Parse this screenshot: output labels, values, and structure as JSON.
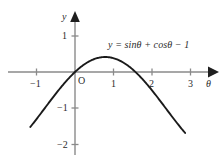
{
  "chart_data": {
    "type": "line",
    "title": "",
    "annotations": [
      {
        "name": "curve-equation",
        "text": "y = sinθ + cosθ − 1",
        "x": 1.0,
        "y": 0.75
      }
    ],
    "xlabel": "θ",
    "ylabel": "y",
    "xlim": [
      -1.45,
      3.55
    ],
    "ylim": [
      -2.35,
      1.35
    ],
    "grid": false,
    "legend": null,
    "x_ticks": [
      -1,
      1,
      2,
      3
    ],
    "x_tick_labels": [
      "−1",
      "1",
      "2",
      "3"
    ],
    "y_ticks": [
      1,
      -1,
      -2
    ],
    "y_tick_labels": [
      "1",
      "−1",
      "−2"
    ],
    "origin_label": "O",
    "series": [
      {
        "name": "y = sinθ + cosθ − 1",
        "color": "#1a1a1a",
        "x_start": -1.16,
        "x_end": 2.86,
        "points": [
          {
            "x": -1.16,
            "y": -1.07
          },
          {
            "x": -1.0,
            "y": -0.9
          },
          {
            "x": -0.8,
            "y": -0.02
          },
          {
            "x": -0.8,
            "y": -0.68
          },
          {
            "x": -0.6,
            "y": -0.74
          },
          {
            "x": -0.4,
            "y": -0.47
          },
          {
            "x": -0.2,
            "y": -0.22
          },
          {
            "x": 0.0,
            "y": 0.0
          },
          {
            "x": 0.2,
            "y": 0.18
          },
          {
            "x": 0.4,
            "y": 0.31
          },
          {
            "x": 0.6,
            "y": 0.39
          },
          {
            "x": 0.785,
            "y": 0.414
          },
          {
            "x": 1.0,
            "y": 0.38
          },
          {
            "x": 1.2,
            "y": 0.29
          },
          {
            "x": 1.4,
            "y": 0.16
          },
          {
            "x": 1.5708,
            "y": 0.0
          },
          {
            "x": 1.8,
            "y": -0.25
          },
          {
            "x": 2.0,
            "y": -0.5
          },
          {
            "x": 2.2,
            "y": -0.78
          },
          {
            "x": 2.4,
            "y": -1.06
          },
          {
            "x": 2.6,
            "y": -1.34
          },
          {
            "x": 2.86,
            "y": -1.68
          }
        ]
      }
    ],
    "axis_color": "#8a8a8a",
    "curve_color": "#1a1a1a",
    "arrowheads": [
      "x-axis-right",
      "y-axis-top"
    ]
  }
}
